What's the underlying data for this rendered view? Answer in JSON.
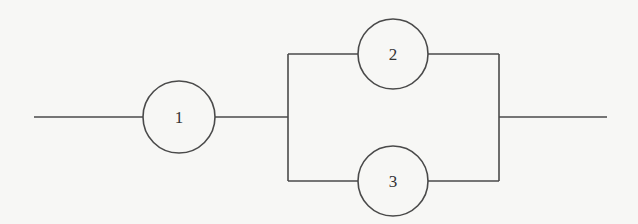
{
  "diagram": {
    "type": "reliability-block-diagram",
    "colors": {
      "background": "#f7f7f5",
      "stroke": "#4a4a4a",
      "text": "#333333"
    },
    "nodes": [
      {
        "id": "1",
        "label": "1",
        "cx": 179,
        "cy": 117,
        "r": 36
      },
      {
        "id": "2",
        "label": "2",
        "cx": 393,
        "cy": 54,
        "r": 35
      },
      {
        "id": "3",
        "label": "3",
        "cx": 393,
        "cy": 181,
        "r": 35
      }
    ],
    "edges": [
      {
        "from": "input",
        "to": "1"
      },
      {
        "from": "1",
        "to": "junction-left"
      },
      {
        "from": "junction-left",
        "to": "2"
      },
      {
        "from": "junction-left",
        "to": "3"
      },
      {
        "from": "2",
        "to": "junction-right"
      },
      {
        "from": "3",
        "to": "junction-right"
      },
      {
        "from": "junction-right",
        "to": "output"
      }
    ],
    "structure": {
      "series": [
        "1",
        {
          "parallel": [
            "2",
            "3"
          ]
        }
      ]
    }
  }
}
